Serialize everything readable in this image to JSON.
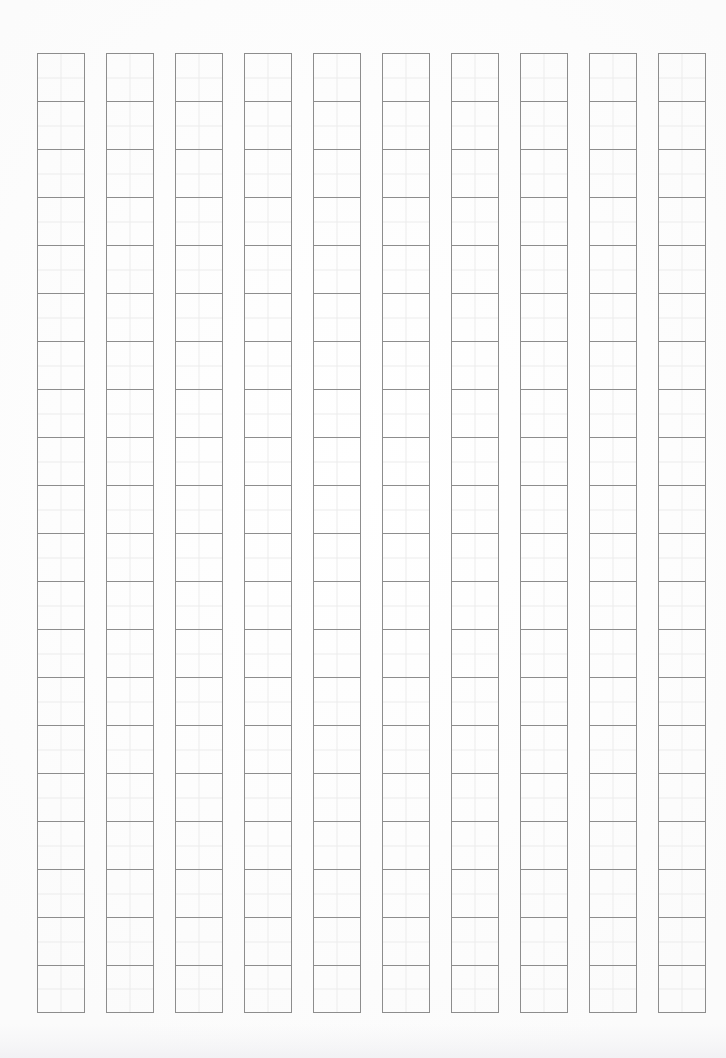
{
  "page": {
    "document_type": "genko-yoshi-blank-sheet",
    "orientation": "portrait",
    "background_color": "#fdfdfd",
    "width_px": 726,
    "height_px": 1058
  },
  "grid": {
    "columns": 10,
    "rows_per_column": 20,
    "total_cells": 200,
    "cell_width_px": 48,
    "cell_height_px": 48,
    "column_gap_px": 21,
    "offset_left_px": 37,
    "offset_top_px": 53,
    "cell_border_color": "#8d8d8d",
    "cell_border_width_px": 1,
    "subdivision": "quadrant-crosshair",
    "subdivision_color": "#ececec",
    "cell_contents": [
      [
        "",
        "",
        "",
        "",
        "",
        "",
        "",
        "",
        "",
        "",
        "",
        "",
        "",
        "",
        "",
        "",
        "",
        "",
        "",
        ""
      ],
      [
        "",
        "",
        "",
        "",
        "",
        "",
        "",
        "",
        "",
        "",
        "",
        "",
        "",
        "",
        "",
        "",
        "",
        "",
        "",
        ""
      ],
      [
        "",
        "",
        "",
        "",
        "",
        "",
        "",
        "",
        "",
        "",
        "",
        "",
        "",
        "",
        "",
        "",
        "",
        "",
        "",
        ""
      ],
      [
        "",
        "",
        "",
        "",
        "",
        "",
        "",
        "",
        "",
        "",
        "",
        "",
        "",
        "",
        "",
        "",
        "",
        "",
        "",
        ""
      ],
      [
        "",
        "",
        "",
        "",
        "",
        "",
        "",
        "",
        "",
        "",
        "",
        "",
        "",
        "",
        "",
        "",
        "",
        "",
        "",
        ""
      ],
      [
        "",
        "",
        "",
        "",
        "",
        "",
        "",
        "",
        "",
        "",
        "",
        "",
        "",
        "",
        "",
        "",
        "",
        "",
        "",
        ""
      ],
      [
        "",
        "",
        "",
        "",
        "",
        "",
        "",
        "",
        "",
        "",
        "",
        "",
        "",
        "",
        "",
        "",
        "",
        "",
        "",
        ""
      ],
      [
        "",
        "",
        "",
        "",
        "",
        "",
        "",
        "",
        "",
        "",
        "",
        "",
        "",
        "",
        "",
        "",
        "",
        "",
        "",
        ""
      ],
      [
        "",
        "",
        "",
        "",
        "",
        "",
        "",
        "",
        "",
        "",
        "",
        "",
        "",
        "",
        "",
        "",
        "",
        "",
        "",
        ""
      ],
      [
        "",
        "",
        "",
        "",
        "",
        "",
        "",
        "",
        "",
        "",
        "",
        "",
        "",
        "",
        "",
        "",
        "",
        "",
        "",
        ""
      ]
    ]
  }
}
